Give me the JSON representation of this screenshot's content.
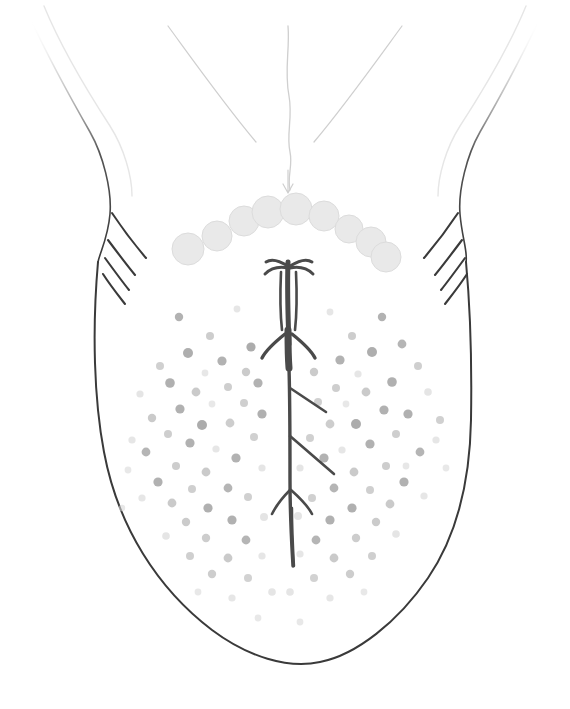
{
  "figure": {
    "title": "Dorsal surface of the tongue",
    "medium": "pencil line drawing, grayscale",
    "background_color": "#ffffff",
    "canvas": {
      "width": 570,
      "height": 709
    }
  },
  "colors": {
    "outline_dark": "#3a3a3a",
    "outline_mid": "#6e6e6e",
    "outline_faint": "#cfcfcf",
    "outline_very_faint": "#e6e6e6",
    "median_sulcus": "#4a4a4a",
    "circumvallate_fill": "#e9e9e9",
    "circumvallate_stroke": "#dcdcdc",
    "fungiform_dark": "#a9a9a9",
    "fungiform_mid": "#c0c0c0",
    "fungiform_light": "#d8d8d8"
  },
  "structures": {
    "tongue_body": {
      "label": "tongue-body-outline",
      "stroke_width": 2.0,
      "path": "M98,262 C92,330 94,400 104,452 C118,527 158,589 212,630 C248,657 288,669 320,662 C356,655 398,622 428,578 C458,534 470,478 471,420 C472,360 470,305 466,262"
    },
    "root_left": {
      "label": "tongue-root-left-edge",
      "stroke_width": 1.6,
      "path": "M30,18 C44,48 66,90 90,132 C103,155 112,190 110,214 C108,238 100,252 98,262"
    },
    "root_right": {
      "label": "tongue-root-right-edge",
      "stroke_width": 1.6,
      "path": "M540,18 C526,48 504,90 480,132 C467,155 458,190 460,214 C462,238 468,252 466,262"
    },
    "root_left_faint": {
      "label": "tongue-root-left-inner-faint",
      "stroke_width": 1.4,
      "path": "M44,6 C58,40 84,86 110,126 C124,148 132,176 132,196"
    },
    "root_right_faint": {
      "label": "tongue-root-right-inner-faint",
      "stroke_width": 1.4,
      "path": "M526,6 C512,40 486,86 460,126 C446,148 438,176 438,196"
    },
    "epiglottic_fold_left": {
      "label": "epiglottic-fold-left",
      "stroke_width": 1.2,
      "path": "M168,26 C190,56 224,104 256,142"
    },
    "epiglottic_fold_right": {
      "label": "epiglottic-fold-right",
      "stroke_width": 1.2,
      "path": "M402,26 C380,56 346,104 314,142"
    },
    "median_line_root": {
      "label": "median-line-root",
      "stroke_width": 1.3,
      "path": "M288,26 C290,50 284,70 289,96 C293,118 286,134 290,152 C293,166 287,176 290,190"
    },
    "foramen_cecum_arrow": {
      "label": "foramen-cecum-marker",
      "stroke_width": 1.2,
      "path": "M288,170 L288,192 M283,184 L288,193 L293,184"
    }
  },
  "circumvallate_papillae": {
    "label": "circumvallate-papillae-row",
    "count": 9,
    "description": "V-shaped (sulcus terminalis) row of large pale circles",
    "circles": [
      {
        "cx": 188,
        "cy": 249,
        "r": 16
      },
      {
        "cx": 217,
        "cy": 236,
        "r": 15
      },
      {
        "cx": 244,
        "cy": 221,
        "r": 15
      },
      {
        "cx": 268,
        "cy": 212,
        "r": 16
      },
      {
        "cx": 296,
        "cy": 209,
        "r": 16
      },
      {
        "cx": 324,
        "cy": 216,
        "r": 15
      },
      {
        "cx": 349,
        "cy": 229,
        "r": 14
      },
      {
        "cx": 371,
        "cy": 242,
        "r": 15
      },
      {
        "cx": 386,
        "cy": 257,
        "r": 15
      }
    ]
  },
  "median_sulcus": {
    "label": "median-sulcus-fissure",
    "description": "dark branched central fissure running from sulcus terminalis to tongue tip",
    "segments": [
      {
        "name": "upper-ladder-trunk",
        "width": 5.0,
        "path": "M288,262 C287,290 288,318 289,344"
      },
      {
        "name": "upper-crown-left",
        "width": 3.0,
        "path": "M288,266 C280,261 272,258 266,262 M288,268 C278,266 270,269 265,274"
      },
      {
        "name": "upper-crown-right",
        "width": 3.0,
        "path": "M290,266 C298,261 306,258 312,262 M290,268 C300,266 308,269 313,274"
      },
      {
        "name": "ladder-rail-left",
        "width": 2.6,
        "path": "M281,272 C280,294 280,312 282,330"
      },
      {
        "name": "ladder-rail-right",
        "width": 2.6,
        "path": "M296,272 C297,294 297,312 295,330"
      },
      {
        "name": "midblock-spread-left",
        "width": 3.4,
        "path": "M285,334 C275,342 266,350 262,358"
      },
      {
        "name": "midblock-spread-right",
        "width": 3.4,
        "path": "M292,334 C302,342 311,350 315,358"
      },
      {
        "name": "midblock-body",
        "width": 7.0,
        "path": "M288,330 C288,344 288,356 289,368"
      },
      {
        "name": "main-trunk",
        "width": 3.4,
        "path": "M289,368 C290,400 290,440 290,480 C290,520 292,548 293,566"
      },
      {
        "name": "branch-right-upper",
        "width": 2.6,
        "path": "M290,388 C302,396 314,404 326,412"
      },
      {
        "name": "branch-right-lower",
        "width": 2.6,
        "path": "M290,436 C304,448 320,462 334,474"
      },
      {
        "name": "fork-left",
        "width": 2.6,
        "path": "M290,490 C282,498 276,506 272,514"
      },
      {
        "name": "fork-right",
        "width": 2.6,
        "path": "M291,490 C300,498 308,506 312,514"
      },
      {
        "name": "tip-tail",
        "width": 2.4,
        "path": "M292,508 C292,530 293,548 294,566"
      }
    ]
  },
  "foliate_papillae": {
    "label": "foliate-papillae",
    "description": "short oblique ridges along each lateral border",
    "left": [
      {
        "path": "M112,213 C122,228 134,244 146,258"
      },
      {
        "path": "M108,240 C117,252 126,264 135,275"
      },
      {
        "path": "M105,258 C113,269 121,280 129,290"
      },
      {
        "path": "M103,274 C110,285 118,295 125,304"
      }
    ],
    "right": [
      {
        "path": "M458,213 C448,228 436,244 424,258"
      },
      {
        "path": "M462,240 C453,252 444,264 435,275"
      },
      {
        "path": "M465,258 C457,269 449,280 441,290"
      },
      {
        "path": "M467,274 C460,285 452,295 445,304"
      }
    ]
  },
  "fungiform_papillae": {
    "label": "fungiform-papillae-field",
    "description": "scattered small grey dots across the anterior two-thirds of the dorsum",
    "dots": [
      [
        179,
        317,
        4.2,
        0.55
      ],
      [
        210,
        336,
        4.0,
        0.45
      ],
      [
        237,
        309,
        3.4,
        0.3
      ],
      [
        251,
        347,
        4.6,
        0.62
      ],
      [
        188,
        353,
        5.0,
        0.6
      ],
      [
        222,
        361,
        4.6,
        0.55
      ],
      [
        160,
        366,
        4.0,
        0.4
      ],
      [
        205,
        373,
        3.4,
        0.28
      ],
      [
        246,
        372,
        4.2,
        0.48
      ],
      [
        170,
        383,
        4.8,
        0.58
      ],
      [
        196,
        392,
        4.4,
        0.5
      ],
      [
        228,
        387,
        4.0,
        0.44
      ],
      [
        258,
        383,
        4.6,
        0.55
      ],
      [
        140,
        394,
        3.6,
        0.32
      ],
      [
        212,
        404,
        3.4,
        0.26
      ],
      [
        180,
        409,
        4.6,
        0.56
      ],
      [
        244,
        403,
        4.0,
        0.42
      ],
      [
        262,
        414,
        4.6,
        0.58
      ],
      [
        152,
        418,
        4.2,
        0.5
      ],
      [
        202,
        425,
        5.0,
        0.62
      ],
      [
        230,
        423,
        4.4,
        0.46
      ],
      [
        168,
        434,
        4.0,
        0.44
      ],
      [
        190,
        443,
        4.6,
        0.56
      ],
      [
        254,
        437,
        4.0,
        0.4
      ],
      [
        216,
        449,
        3.6,
        0.3
      ],
      [
        146,
        452,
        4.4,
        0.52
      ],
      [
        236,
        458,
        4.6,
        0.55
      ],
      [
        176,
        466,
        4.0,
        0.46
      ],
      [
        206,
        472,
        4.4,
        0.5
      ],
      [
        262,
        468,
        3.6,
        0.32
      ],
      [
        158,
        482,
        4.6,
        0.56
      ],
      [
        192,
        489,
        4.0,
        0.42
      ],
      [
        228,
        488,
        4.4,
        0.52
      ],
      [
        248,
        497,
        4.0,
        0.4
      ],
      [
        172,
        503,
        4.4,
        0.5
      ],
      [
        208,
        508,
        4.6,
        0.58
      ],
      [
        142,
        498,
        3.6,
        0.3
      ],
      [
        186,
        522,
        4.2,
        0.48
      ],
      [
        232,
        520,
        4.6,
        0.56
      ],
      [
        264,
        517,
        4.0,
        0.36
      ],
      [
        206,
        538,
        4.2,
        0.46
      ],
      [
        166,
        536,
        3.8,
        0.34
      ],
      [
        246,
        540,
        4.4,
        0.52
      ],
      [
        190,
        556,
        4.0,
        0.42
      ],
      [
        228,
        558,
        4.4,
        0.5
      ],
      [
        262,
        556,
        3.6,
        0.3
      ],
      [
        212,
        574,
        4.2,
        0.46
      ],
      [
        248,
        578,
        4.0,
        0.38
      ],
      [
        272,
        592,
        3.8,
        0.34
      ],
      [
        232,
        598,
        3.6,
        0.3
      ],
      [
        198,
        592,
        3.4,
        0.26
      ],
      [
        382,
        317,
        4.2,
        0.55
      ],
      [
        352,
        336,
        4.0,
        0.45
      ],
      [
        330,
        312,
        3.4,
        0.3
      ],
      [
        402,
        344,
        4.4,
        0.52
      ],
      [
        372,
        352,
        5.0,
        0.6
      ],
      [
        340,
        360,
        4.6,
        0.55
      ],
      [
        418,
        366,
        4.0,
        0.42
      ],
      [
        358,
        374,
        3.6,
        0.3
      ],
      [
        314,
        372,
        4.2,
        0.48
      ],
      [
        392,
        382,
        4.8,
        0.58
      ],
      [
        366,
        392,
        4.4,
        0.5
      ],
      [
        336,
        388,
        4.0,
        0.44
      ],
      [
        428,
        392,
        3.8,
        0.34
      ],
      [
        346,
        404,
        3.4,
        0.26
      ],
      [
        384,
        410,
        4.6,
        0.56
      ],
      [
        318,
        402,
        4.0,
        0.4
      ],
      [
        408,
        414,
        4.6,
        0.58
      ],
      [
        356,
        424,
        5.0,
        0.62
      ],
      [
        330,
        424,
        4.4,
        0.46
      ],
      [
        440,
        420,
        4.0,
        0.4
      ],
      [
        396,
        434,
        4.0,
        0.44
      ],
      [
        370,
        444,
        4.6,
        0.56
      ],
      [
        310,
        438,
        4.0,
        0.4
      ],
      [
        342,
        450,
        3.6,
        0.3
      ],
      [
        420,
        452,
        4.4,
        0.52
      ],
      [
        324,
        458,
        4.6,
        0.55
      ],
      [
        386,
        466,
        4.0,
        0.46
      ],
      [
        354,
        472,
        4.4,
        0.5
      ],
      [
        300,
        468,
        3.6,
        0.32
      ],
      [
        404,
        482,
        4.6,
        0.56
      ],
      [
        370,
        490,
        4.0,
        0.42
      ],
      [
        334,
        488,
        4.4,
        0.52
      ],
      [
        312,
        498,
        4.0,
        0.4
      ],
      [
        390,
        504,
        4.4,
        0.5
      ],
      [
        352,
        508,
        4.6,
        0.58
      ],
      [
        424,
        496,
        3.6,
        0.3
      ],
      [
        376,
        522,
        4.2,
        0.48
      ],
      [
        330,
        520,
        4.6,
        0.56
      ],
      [
        298,
        516,
        4.0,
        0.36
      ],
      [
        356,
        538,
        4.2,
        0.46
      ],
      [
        396,
        534,
        3.8,
        0.34
      ],
      [
        316,
        540,
        4.4,
        0.52
      ],
      [
        372,
        556,
        4.0,
        0.42
      ],
      [
        334,
        558,
        4.4,
        0.5
      ],
      [
        300,
        554,
        3.6,
        0.3
      ],
      [
        350,
        574,
        4.2,
        0.46
      ],
      [
        314,
        578,
        4.0,
        0.38
      ],
      [
        290,
        592,
        3.8,
        0.34
      ],
      [
        330,
        598,
        3.6,
        0.3
      ],
      [
        364,
        592,
        3.4,
        0.26
      ],
      [
        406,
        466,
        3.4,
        0.28
      ],
      [
        436,
        440,
        3.6,
        0.3
      ],
      [
        446,
        468,
        3.4,
        0.26
      ],
      [
        128,
        470,
        3.4,
        0.26
      ],
      [
        132,
        440,
        3.6,
        0.3
      ],
      [
        122,
        508,
        3.2,
        0.24
      ],
      [
        258,
        618,
        3.4,
        0.26
      ],
      [
        300,
        622,
        3.4,
        0.26
      ]
    ]
  }
}
